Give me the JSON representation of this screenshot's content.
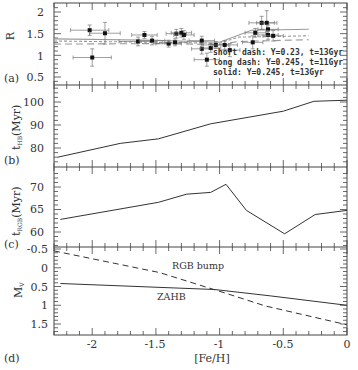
{
  "figure": {
    "xlabel": "[Fe/H]",
    "x_ticks": [
      "-2",
      "-1.5",
      "-1",
      "-0.5",
      "0"
    ],
    "x_tick_values": [
      -2,
      -1.5,
      -1,
      -0.5,
      0
    ],
    "xlim": [
      -2.3,
      0
    ]
  },
  "panels": [
    {
      "tag": "(a)",
      "ylabel": "R",
      "y_ticks": [
        "2",
        "1.5",
        "1",
        "0.5"
      ],
      "legend": [
        "short dash: Y=0.23, t=13Gyr",
        "long dash: Y=0.245, t=11Gyr",
        "solid: Y=0.245, t=13Gyr"
      ]
    },
    {
      "tag": "(b)",
      "ylabel_main": "t",
      "ylabel_sub": "HB",
      "ylabel_unit": "(Myr)",
      "y_ticks": [
        "100",
        "90",
        "80"
      ]
    },
    {
      "tag": "(c)",
      "ylabel_main": "t",
      "ylabel_sub": "RGB",
      "ylabel_unit": "(Myr)",
      "y_ticks": [
        "70",
        "65",
        "60"
      ]
    },
    {
      "tag": "(d)",
      "ylabel_main": "M",
      "ylabel_sub": "V",
      "y_ticks": [
        "-0.5",
        "0",
        "0.5",
        "1",
        "1.5"
      ],
      "labels": {
        "rgb_bump": "RGB bump",
        "zahb": "ZAHB"
      }
    }
  ],
  "chart_data": [
    {
      "type": "scatter",
      "panel": "(a)",
      "title": "",
      "xlabel": "[Fe/H]",
      "ylabel": "R",
      "xlim": [
        -2.3,
        0
      ],
      "ylim": [
        0.3,
        2.2
      ],
      "points": [
        {
          "x": -2.02,
          "y": 1.58,
          "xerr": 0.15,
          "yerr": 0.12
        },
        {
          "x": -1.9,
          "y": 1.51,
          "xerr": 0.12,
          "yerr": 0.25
        },
        {
          "x": -2.0,
          "y": 0.95,
          "xerr": 0.15,
          "yerr": 0.2
        },
        {
          "x": -1.64,
          "y": 1.32,
          "xerr": 0.15,
          "yerr": 0.1
        },
        {
          "x": -1.59,
          "y": 1.47,
          "xerr": 0.1,
          "yerr": 0.08
        },
        {
          "x": -1.53,
          "y": 1.34,
          "xerr": 0.1,
          "yerr": 0.1
        },
        {
          "x": -1.4,
          "y": 1.27,
          "xerr": 0.1,
          "yerr": 0.08
        },
        {
          "x": -1.35,
          "y": 1.3,
          "xerr": 0.1,
          "yerr": 0.08
        },
        {
          "x": -1.34,
          "y": 1.5,
          "xerr": 0.08,
          "yerr": 0.1
        },
        {
          "x": -1.3,
          "y": 1.52,
          "xerr": 0.08,
          "yerr": 0.1
        },
        {
          "x": -1.28,
          "y": 1.47,
          "xerr": 0.08,
          "yerr": 0.1
        },
        {
          "x": -1.14,
          "y": 1.34,
          "xerr": 0.1,
          "yerr": 0.1
        },
        {
          "x": -1.14,
          "y": 1.15,
          "xerr": 0.08,
          "yerr": 0.12
        },
        {
          "x": -1.1,
          "y": 0.9,
          "xerr": 0.1,
          "yerr": 0.15
        },
        {
          "x": -1.07,
          "y": 1.17,
          "xerr": 0.08,
          "yerr": 0.1
        },
        {
          "x": -1.03,
          "y": 1.24,
          "xerr": 0.1,
          "yerr": 0.08
        },
        {
          "x": -0.96,
          "y": 1.24,
          "xerr": 0.1,
          "yerr": 0.1
        },
        {
          "x": -0.92,
          "y": 1.12,
          "xerr": 0.08,
          "yerr": 0.15
        },
        {
          "x": -0.74,
          "y": 1.3,
          "xerr": 0.08,
          "yerr": 0.15
        },
        {
          "x": -0.72,
          "y": 1.52,
          "xerr": 0.08,
          "yerr": 0.1
        },
        {
          "x": -0.67,
          "y": 1.75,
          "xerr": 0.1,
          "yerr": 0.15
        },
        {
          "x": -0.63,
          "y": 1.75,
          "xerr": 0.08,
          "yerr": 0.28
        },
        {
          "x": -0.62,
          "y": 1.6,
          "xerr": 0.08,
          "yerr": 0.1
        },
        {
          "x": -0.62,
          "y": 1.47,
          "xerr": 0.08,
          "yerr": 0.1
        },
        {
          "x": -0.58,
          "y": 1.45,
          "xerr": 0.08,
          "yerr": 0.12
        }
      ],
      "series": [
        {
          "name": "short dash: Y=0.23, t=13Gyr",
          "style": "short-dash",
          "x": [
            -2.3,
            -1.5,
            -1.0,
            -0.85,
            -0.3
          ],
          "y": [
            1.33,
            1.3,
            1.28,
            1.42,
            1.45
          ]
        },
        {
          "name": "long dash: Y=0.245, t=11Gyr",
          "style": "long-dash",
          "x": [
            -2.3,
            -1.5,
            -1.0,
            -0.85,
            -0.3
          ],
          "y": [
            1.26,
            1.27,
            1.25,
            1.32,
            1.36
          ]
        },
        {
          "name": "solid: Y=0.245, t=13Gyr",
          "style": "solid",
          "x": [
            -2.3,
            -1.5,
            -1.0,
            -0.75,
            -0.3
          ],
          "y": [
            1.38,
            1.35,
            1.3,
            1.58,
            1.6
          ]
        }
      ]
    },
    {
      "type": "line",
      "panel": "(b)",
      "title": "",
      "xlabel": "[Fe/H]",
      "ylabel": "t_HB (Myr)",
      "xlim": [
        -2.3,
        0
      ],
      "ylim": [
        72,
        107
      ],
      "x": [
        -2.27,
        -1.78,
        -1.48,
        -1.07,
        -0.5,
        -0.26,
        0.0
      ],
      "y": [
        76,
        82,
        84,
        90.5,
        96,
        100.3,
        100.8
      ]
    },
    {
      "type": "line",
      "panel": "(c)",
      "title": "",
      "xlabel": "[Fe/H]",
      "ylabel": "t_RGB (Myr)",
      "xlim": [
        -2.3,
        0
      ],
      "ylim": [
        57,
        73
      ],
      "x": [
        -2.25,
        -1.48,
        -1.26,
        -1.07,
        -0.95,
        -0.79,
        -0.49,
        -0.25,
        0.0
      ],
      "y": [
        62.8,
        66.6,
        68.4,
        68.8,
        70.6,
        64.8,
        59.6,
        63.9,
        64.8
      ]
    },
    {
      "type": "line",
      "panel": "(d)",
      "title": "",
      "xlabel": "[Fe/H]",
      "ylabel": "M_V",
      "xlim": [
        -2.3,
        0
      ],
      "ylim": [
        1.75,
        -0.6
      ],
      "series": [
        {
          "name": "RGB bump",
          "style": "dashed",
          "x": [
            -2.3,
            -1.47,
            -0.96,
            -0.64,
            0.0
          ],
          "y": [
            -0.45,
            0.13,
            0.67,
            1.02,
            1.52
          ]
        },
        {
          "name": "ZAHB",
          "style": "solid",
          "x": [
            -2.25,
            -1.04,
            -0.6,
            0.0
          ],
          "y": [
            0.42,
            0.58,
            0.75,
            1.0
          ]
        }
      ]
    }
  ]
}
